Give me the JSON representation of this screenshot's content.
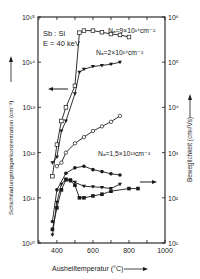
{
  "chart_data": {
    "type": "line",
    "title": "",
    "annotation": [
      "Sb : Si",
      "E = 40 keV"
    ],
    "xlabel": "Ausheiltemperatur (°C)",
    "ylabel_left": "Schichtladungsträgerkonzentration (cm⁻²)",
    "ylabel_right": "Beweglichkeit (cm²/Vs)",
    "xlim": [
      295,
      1000
    ],
    "x_ticks": [
      400,
      600,
      800,
      1000
    ],
    "ylim_left_log10": [
      10,
      15
    ],
    "ylim_right_log10": [
      1,
      6
    ],
    "y_ticks_left": [
      "10^10",
      "10^11",
      "10^12",
      "10^13",
      "10^14",
      "10^15"
    ],
    "y_ticks_right": [
      "10^1",
      "10^2",
      "10^3",
      "10^4",
      "10^5",
      "10^6"
    ],
    "grid": false,
    "legend": "inline labels on curves",
    "series": [
      {
        "name": "Na = 9×10^14 cm^-2 (carrier conc.)",
        "label": "Nₐ=9×10¹⁴cm⁻²",
        "axis": "left",
        "marker": "open-square",
        "x": [
          375,
          400,
          425,
          450,
          500,
          525,
          550,
          600,
          650,
          700,
          750,
          800
        ],
        "y": [
          300000000000.0,
          1500000000000.0,
          5000000000000.0,
          10000000000000.0,
          30000000000000.0,
          450000000000000.0,
          500000000000000.0,
          500000000000000.0,
          460000000000000.0,
          420000000000000.0,
          400000000000000.0,
          360000000000000.0
        ]
      },
      {
        "name": "Na = 2×10^14 cm^-2 (carrier conc.)",
        "label": "Nₐ=2×10¹⁴cm⁻²",
        "axis": "left",
        "marker": "filled-triangle",
        "x": [
          375,
          400,
          425,
          450,
          500,
          525,
          550,
          600,
          650,
          700,
          750
        ],
        "y": [
          600000000000.0,
          800000000000.0,
          3000000000000.0,
          5000000000000.0,
          20000000000000.0,
          60000000000000.0,
          70000000000000.0,
          80000000000000.0,
          85000000000000.0,
          90000000000000.0,
          100000000000000.0
        ]
      },
      {
        "name": "Na = 1.5×10^13 cm^-2 (carrier conc.)",
        "label": "Nₐ=1,5×10¹³cm⁻²",
        "axis": "left",
        "marker": "open-circle",
        "x": [
          400,
          425,
          450,
          500,
          550,
          600,
          650,
          700,
          750
        ],
        "y": [
          500000000000.0,
          600000000000.0,
          1000000000000.0,
          1600000000000.0,
          2200000000000.0,
          3000000000000.0,
          3800000000000.0,
          4800000000000.0,
          6500000000000.0
        ]
      },
      {
        "name": "Na = 1.5×10^13 cm^-2 (mobility)",
        "axis": "right",
        "marker": "filled-circle",
        "x": [
          375,
          400,
          450,
          500,
          550,
          600,
          650,
          700,
          750
        ],
        "y": [
          30,
          150,
          350,
          460,
          500,
          420,
          380,
          340,
          320
        ]
      },
      {
        "name": "Na = 9×10^14 cm^-2 (mobility)",
        "axis": "right",
        "marker": "filled-square",
        "x": [
          375,
          400,
          425,
          450,
          475,
          500,
          525,
          550,
          600,
          650,
          700,
          800,
          850
        ],
        "y": [
          20,
          60,
          150,
          250,
          240,
          190,
          100,
          100,
          110,
          120,
          140,
          160,
          160
        ]
      },
      {
        "name": "Na = 2×10^14 cm^-2 (mobility)",
        "axis": "right",
        "marker": "filled-triangle",
        "x": [
          375,
          400,
          425,
          450,
          475,
          500,
          550,
          600,
          650,
          700,
          750
        ],
        "y": [
          15,
          80,
          200,
          260,
          250,
          220,
          180,
          175,
          170,
          160,
          200
        ]
      }
    ],
    "arrows": [
      {
        "direction": "left",
        "meaning": "upper curves refer to left axis"
      },
      {
        "direction": "right",
        "meaning": "lower curves refer to right axis"
      }
    ]
  },
  "labels": {
    "annotation_line1": "Sb : Si",
    "annotation_line2": "E = 40 keV",
    "xlabel": "Ausheiltemperatur (°C)",
    "ylabel_left": "Schichtladungsträgerkonzentration (cm⁻²)",
    "ylabel_right": "Beweglichkeit (cm²/Vs)"
  }
}
